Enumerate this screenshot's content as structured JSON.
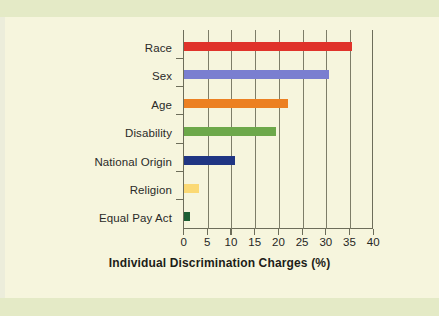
{
  "chart_data": {
    "type": "bar",
    "orientation": "horizontal",
    "title": "",
    "xlabel": "Individual Discrimination Charges (%)",
    "ylabel": "",
    "categories": [
      "Race",
      "Sex",
      "Age",
      "Disability",
      "National Origin",
      "Religion",
      "Equal Pay Act"
    ],
    "values": [
      35.6,
      30.7,
      22.1,
      19.5,
      10.7,
      3.1,
      1.2
    ],
    "bar_colors": [
      "#e0332a",
      "#7a7fd0",
      "#ec8022",
      "#6da84a",
      "#1f3583",
      "#fbd974",
      "#1c5e33"
    ],
    "xlim": [
      0,
      40
    ],
    "xticks": [
      0,
      5,
      10,
      15,
      20,
      25,
      30,
      35,
      40
    ],
    "xtick_labels": [
      "0",
      "5",
      "10",
      "15",
      "20",
      "25",
      "30",
      "35",
      "40"
    ],
    "grid": "vertical",
    "legend": "none",
    "background_color": "#f6f5dd",
    "band_color": "#e4eac6",
    "axis_color": "#6d6d5a"
  }
}
